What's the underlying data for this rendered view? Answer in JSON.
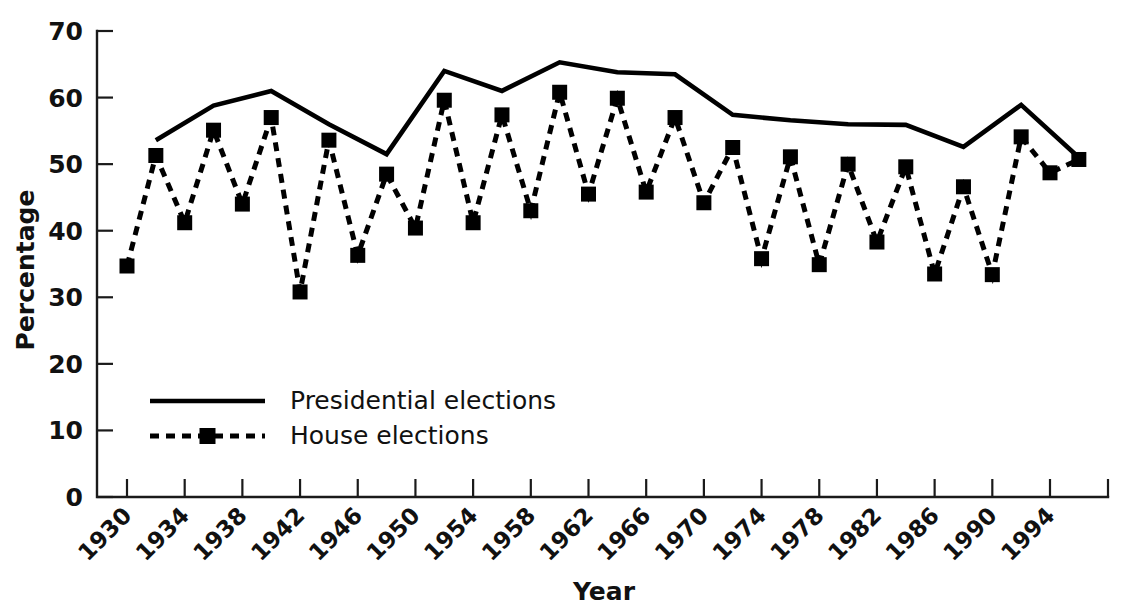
{
  "chart_data": {
    "type": "line",
    "title": "",
    "xlabel": "Year",
    "ylabel": "Percentage",
    "xlim": [
      1930,
      1998
    ],
    "ylim": [
      0,
      70
    ],
    "ytick_labels": [
      "0",
      "10",
      "20",
      "30",
      "40",
      "50",
      "60",
      "70"
    ],
    "ytick_values": [
      0,
      10,
      20,
      30,
      40,
      50,
      60,
      70
    ],
    "xtick_labels": [
      "1930",
      "1934",
      "1938",
      "1942",
      "1946",
      "1950",
      "1954",
      "1958",
      "1962",
      "1966",
      "1970",
      "1974",
      "1978",
      "1982",
      "1986",
      "1990",
      "1994"
    ],
    "xtick_values": [
      1930,
      1934,
      1938,
      1942,
      1946,
      1950,
      1954,
      1958,
      1962,
      1966,
      1970,
      1974,
      1978,
      1982,
      1986,
      1990,
      1994
    ],
    "grid": false,
    "legend_position": "inside-lower-left",
    "series": [
      {
        "name": "Presidential elections",
        "style": "solid",
        "marker": "none",
        "x": [
          1932,
          1936,
          1940,
          1944,
          1948,
          1952,
          1956,
          1960,
          1964,
          1968,
          1972,
          1976,
          1980,
          1984,
          1988,
          1992,
          1996
        ],
        "values": [
          53.6,
          58.8,
          61.0,
          56.0,
          51.5,
          64.0,
          61.0,
          65.3,
          63.8,
          63.5,
          57.4,
          56.6,
          56.0,
          55.9,
          52.6,
          58.9,
          51.0
        ]
      },
      {
        "name": "House elections",
        "style": "dashed",
        "marker": "square",
        "x": [
          1930,
          1932,
          1934,
          1936,
          1938,
          1940,
          1942,
          1944,
          1946,
          1948,
          1950,
          1952,
          1954,
          1956,
          1958,
          1960,
          1962,
          1964,
          1966,
          1968,
          1970,
          1972,
          1974,
          1976,
          1978,
          1980,
          1982,
          1984,
          1986,
          1988,
          1990,
          1992,
          1994,
          1996
        ],
        "values": [
          34.7,
          51.3,
          41.2,
          55.1,
          44.0,
          57.0,
          30.8,
          53.6,
          36.3,
          48.5,
          40.4,
          59.6,
          41.2,
          57.4,
          43.0,
          60.8,
          45.5,
          59.9,
          45.8,
          57.0,
          44.2,
          52.5,
          35.8,
          51.1,
          34.9,
          50.0,
          38.3,
          49.6,
          33.5,
          46.6,
          33.4,
          54.1,
          48.7,
          50.7
        ]
      }
    ],
    "legend": [
      {
        "label": "Presidential elections",
        "style": "solid",
        "marker": "none"
      },
      {
        "label": "House elections",
        "style": "dashed",
        "marker": "square"
      }
    ]
  }
}
